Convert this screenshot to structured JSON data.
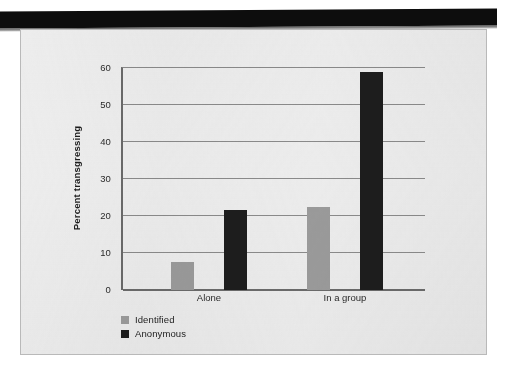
{
  "chart_data": {
    "type": "bar",
    "title": "",
    "xlabel": "",
    "ylabel": "Percent transgressing",
    "categories": [
      "Alone",
      "In a group"
    ],
    "series": [
      {
        "name": "Identified",
        "color": "#9a9a9a",
        "values": [
          7.5,
          22.5
        ]
      },
      {
        "name": "Anonymous",
        "color": "#1d1d1d",
        "values": [
          21.5,
          59.0
        ]
      }
    ],
    "ylim": [
      0,
      60
    ],
    "yticks": [
      0,
      10,
      20,
      30,
      40,
      50,
      60
    ],
    "ytick_labels": [
      "0",
      "10",
      "20",
      "30",
      "40",
      "50",
      "60"
    ],
    "grid": "horizontal",
    "legend_position": "below-left",
    "legend": [
      {
        "label": "Identified",
        "color": "#9a9a9a"
      },
      {
        "label": "Anonymous",
        "color": "#1d1d1d"
      }
    ]
  },
  "axis": {
    "y_title": "Percent transgressing",
    "ticks": {
      "t60": "60",
      "t50": "50",
      "t40": "40",
      "t30": "30",
      "t20": "20",
      "t10": "10",
      "t0": "0"
    },
    "x_labels": {
      "alone": "Alone",
      "in_a_group": "In a group"
    }
  },
  "legend": {
    "identified": "Identified",
    "anonymous": "Anonymous"
  },
  "colors": {
    "identified_bar": "#9a9a9a",
    "anonymous_bar": "#1d1d1d",
    "panel_background": "#eeeeee",
    "axis_line": "#6a6a6a",
    "gridline": "#8a8a8a",
    "scan_band": "#0d0d0d"
  }
}
